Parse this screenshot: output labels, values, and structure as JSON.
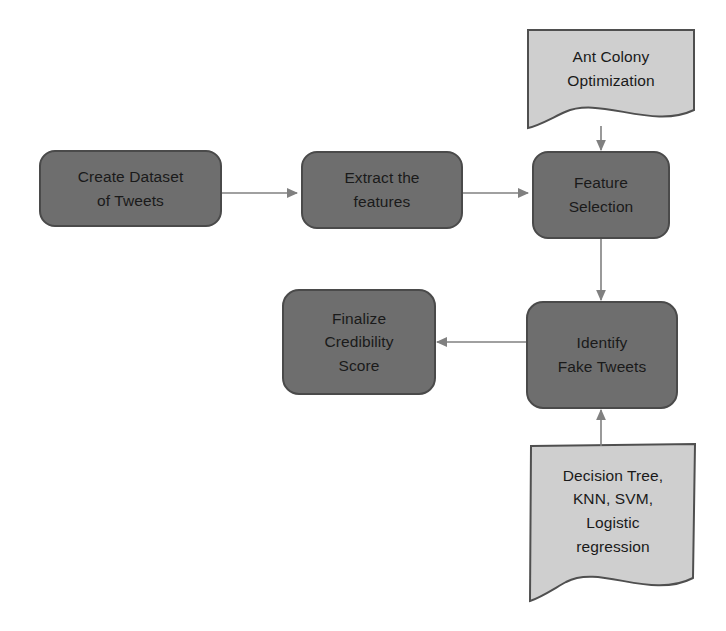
{
  "diagram": {
    "background_color": "#ffffff",
    "process_fill": "#6e6e6e",
    "process_stroke": "#4a4a4a",
    "document_fill": "#cfcfcf",
    "document_stroke": "#4f4f4f",
    "connector_color": "#808080",
    "text_color": "#1a1a1a"
  },
  "nodes": {
    "create_dataset": {
      "shape": "rounded-rectangle",
      "lines": [
        "Create Dataset",
        "of Tweets"
      ],
      "line1": "Create Dataset",
      "line2": "of Tweets"
    },
    "extract_features": {
      "shape": "rounded-rectangle",
      "lines": [
        "Extract the",
        "features"
      ],
      "line1": "Extract the",
      "line2": "features"
    },
    "feature_selection": {
      "shape": "rounded-rectangle",
      "lines": [
        "Feature",
        "Selection"
      ],
      "line1": "Feature",
      "line2": "Selection"
    },
    "ant_colony": {
      "shape": "document",
      "lines": [
        "Ant Colony",
        "Optimization"
      ],
      "line1": "Ant Colony",
      "line2": "Optimization"
    },
    "identify_fake_tweets": {
      "shape": "rounded-rectangle",
      "lines": [
        "Identify",
        "Fake Tweets"
      ],
      "line1": "Identify",
      "line2": "Fake Tweets"
    },
    "finalize_credibility": {
      "shape": "rounded-rectangle",
      "lines": [
        "Finalize",
        "Credibility",
        "Score"
      ],
      "line1": "Finalize",
      "line2": "Credibility",
      "line3": "Score"
    },
    "classifiers": {
      "shape": "document",
      "lines": [
        "Decision Tree,",
        "KNN, SVM,",
        "Logistic",
        "regression"
      ],
      "line1": "Decision Tree,",
      "line2": "KNN, SVM,",
      "line3": "Logistic",
      "line4": "regression"
    }
  },
  "edges": [
    {
      "id": "e1",
      "from": "create_dataset",
      "to": "extract_features",
      "direction": "right"
    },
    {
      "id": "e2",
      "from": "extract_features",
      "to": "feature_selection",
      "direction": "right"
    },
    {
      "id": "e3",
      "from": "ant_colony",
      "to": "feature_selection",
      "direction": "down"
    },
    {
      "id": "e4",
      "from": "feature_selection",
      "to": "identify_fake_tweets",
      "direction": "down"
    },
    {
      "id": "e5",
      "from": "identify_fake_tweets",
      "to": "finalize_credibility",
      "direction": "left"
    },
    {
      "id": "e6",
      "from": "classifiers",
      "to": "identify_fake_tweets",
      "direction": "up"
    }
  ]
}
